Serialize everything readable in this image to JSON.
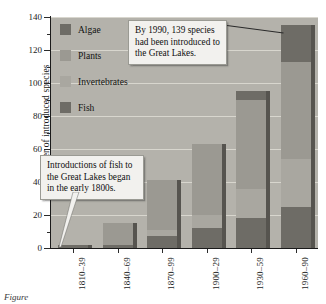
{
  "figure": {
    "caption": "Figure"
  },
  "axes": {
    "y_title": "Number of introduced species",
    "y_ticks": [
      "0",
      "20",
      "40",
      "60",
      "80",
      "100",
      "120",
      "140"
    ],
    "x_ticks": [
      "1810–39",
      "1840–69",
      "1870–99",
      "1900–29",
      "1930–59",
      "1960–90"
    ]
  },
  "legend": {
    "items": [
      {
        "label": "Algae",
        "color": "#6e6c66"
      },
      {
        "label": "Plants",
        "color": "#9b9992"
      },
      {
        "label": "Invertebrates",
        "color": "#a9a7a0"
      },
      {
        "label": "Fish",
        "color": "#6e6c66"
      }
    ]
  },
  "callouts": [
    {
      "id": "callout-1990",
      "text": "By 1990, 139 species had been introduced to the Great Lakes."
    },
    {
      "id": "callout-fish",
      "text": "Introductions of fish to the Great Lakes began in the early 1800s."
    }
  ],
  "chart_data": {
    "type": "bar",
    "subtype": "stacked",
    "title": "",
    "xlabel": "",
    "ylabel": "Number of introduced species",
    "ylim": [
      0,
      140
    ],
    "ytick_step": 20,
    "yminor_step": 10,
    "grid": true,
    "legend_position": "inside-top-left",
    "categories": [
      "1810–39",
      "1840–69",
      "1870–99",
      "1900–29",
      "1930–59",
      "1960–90"
    ],
    "series": [
      {
        "name": "Fish",
        "color": "#6e6c66",
        "values": [
          2,
          2,
          7,
          12,
          18,
          25
        ]
      },
      {
        "name": "Invertebrates",
        "color": "#a9a7a0",
        "values": [
          0,
          0,
          4,
          8,
          18,
          29
        ]
      },
      {
        "name": "Plants",
        "color": "#9b9992",
        "values": [
          0,
          13,
          30,
          43,
          54,
          59
        ]
      },
      {
        "name": "Algae",
        "color": "#6e6c66",
        "values": [
          0,
          0,
          0,
          0,
          5,
          22
        ]
      }
    ],
    "totals": [
      2,
      15,
      41,
      63,
      95,
      135
    ],
    "annotations": [
      "By 1990, 139 species had been introduced to the Great Lakes.",
      "Introductions of fish to the Great Lakes began in the early 1800s."
    ]
  }
}
